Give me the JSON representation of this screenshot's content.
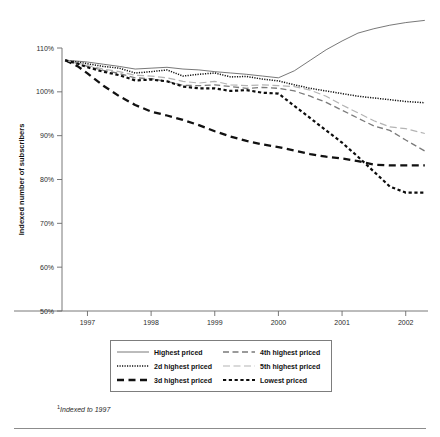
{
  "chart_data": {
    "type": "line",
    "title": "",
    "xlabel": "",
    "ylabel": "Indexed number of subscribers",
    "footnote": "Indexed to 1997",
    "footnote_marker": "1",
    "xlim": [
      1996.6,
      2002.35
    ],
    "ylim": [
      50,
      110
    ],
    "ytick_labels": [
      "110%",
      "100%",
      "90%",
      "80%",
      "70%",
      "60%",
      "50%"
    ],
    "ytick_values": [
      110,
      100,
      90,
      80,
      70,
      60,
      50
    ],
    "xtick_labels": [
      "1997",
      "1998",
      "1999",
      "2000",
      "2001",
      "2002"
    ],
    "xtick_values": [
      1997,
      1998,
      1999,
      2000,
      2001,
      2002
    ],
    "grid": false,
    "legend_position": "bottom-center",
    "x": [
      1996.65,
      1996.85,
      1997.0,
      1997.25,
      1997.5,
      1997.75,
      1998.0,
      1998.25,
      1998.5,
      1998.75,
      1999.0,
      1999.25,
      1999.5,
      1999.75,
      2000.0,
      2000.25,
      2000.5,
      2000.75,
      2001.0,
      2001.25,
      2001.5,
      2001.75,
      2002.0,
      2002.3
    ],
    "series": [
      {
        "name": "Highest priced",
        "style": "thin-solid",
        "color": "#555555",
        "values": [
          107.2,
          107.0,
          106.8,
          106.3,
          105.8,
          105.2,
          105.4,
          105.6,
          105.2,
          105.0,
          104.6,
          104.3,
          104.0,
          103.6,
          103.2,
          104.8,
          107.2,
          109.6,
          111.6,
          113.4,
          114.4,
          115.2,
          115.8,
          116.3
        ]
      },
      {
        "name": "2d highest priced",
        "style": "dotted",
        "color": "#111111",
        "values": [
          107.2,
          106.8,
          106.4,
          105.8,
          105.4,
          104.3,
          104.6,
          105.0,
          103.6,
          104.0,
          104.3,
          103.4,
          103.5,
          102.9,
          102.5,
          101.6,
          100.8,
          100.2,
          99.6,
          99.0,
          98.6,
          98.2,
          97.8,
          97.5
        ]
      },
      {
        "name": "3d highest priced",
        "style": "thick-dash",
        "color": "#111111",
        "values": [
          107.2,
          105.8,
          104.2,
          101.4,
          99.0,
          97.0,
          95.5,
          94.6,
          93.6,
          92.4,
          91.0,
          89.8,
          88.8,
          88.0,
          87.4,
          86.6,
          85.8,
          85.2,
          84.8,
          84.2,
          83.4,
          83.2,
          83.2,
          83.2
        ]
      },
      {
        "name": "4th highest priced",
        "style": "gray-dash",
        "color": "#7a7a7a",
        "values": [
          107.2,
          106.5,
          105.8,
          104.9,
          104.2,
          103.2,
          103.0,
          102.4,
          101.5,
          101.4,
          101.6,
          101.2,
          100.8,
          101.0,
          100.8,
          100.2,
          99.0,
          97.6,
          95.8,
          94.0,
          92.2,
          91.2,
          89.0,
          86.5
        ]
      },
      {
        "name": "5th highest priced",
        "style": "light-gray-dash",
        "color": "#b4b4b4",
        "values": [
          107.2,
          106.6,
          106.0,
          105.2,
          104.6,
          103.8,
          103.6,
          103.2,
          102.4,
          102.0,
          102.4,
          101.6,
          101.4,
          101.6,
          101.4,
          101.2,
          100.4,
          99.0,
          97.0,
          95.2,
          93.4,
          92.0,
          91.6,
          90.5
        ]
      },
      {
        "name": "Lowest priced",
        "style": "bold-short-dash",
        "color": "#0d0d0d",
        "values": [
          107.2,
          106.4,
          105.6,
          104.6,
          103.8,
          102.6,
          102.8,
          102.4,
          101.2,
          100.8,
          100.8,
          100.2,
          100.4,
          99.8,
          99.6,
          96.8,
          94.0,
          91.2,
          88.4,
          85.2,
          81.8,
          78.4,
          77.0,
          77.0
        ]
      }
    ]
  },
  "legend": {
    "entries": [
      {
        "label": "Highest priced"
      },
      {
        "label": "4th highest priced"
      },
      {
        "label": "2d highest priced"
      },
      {
        "label": "5th highest priced"
      },
      {
        "label": "3d highest priced"
      },
      {
        "label": "Lowest priced"
      }
    ]
  }
}
